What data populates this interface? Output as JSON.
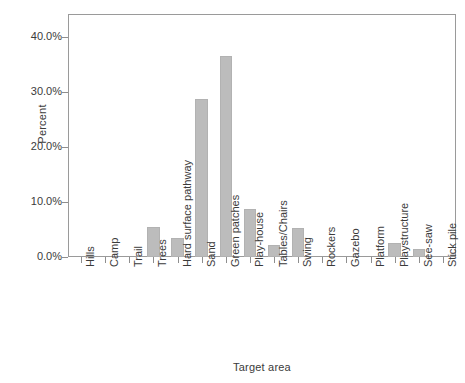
{
  "chart_data": {
    "type": "bar",
    "title": "",
    "xlabel": "Target area",
    "ylabel": "Percent",
    "ylim": [
      0,
      44
    ],
    "ytick_values": [
      0,
      10,
      20,
      30,
      40
    ],
    "ytick_labels": [
      "0.0%",
      "10.0%",
      "20.0%",
      "30.0%",
      "40.0%"
    ],
    "grid": false,
    "legend": false,
    "bar_color": "#bcbcbc",
    "categories": [
      "Hills",
      "Camp",
      "Trail",
      "Trees",
      "Hard surface pathway",
      "Sand",
      "Green patches",
      "Play-house",
      "Tables/Chairs",
      "Swing",
      "Rockers",
      "Gazebo",
      "Platform",
      "Playstructure",
      "See-saw",
      "Stick pile"
    ],
    "values": [
      0,
      0,
      0,
      5.4,
      3.4,
      28.8,
      36.6,
      8.7,
      2.2,
      5.2,
      0,
      0,
      0,
      2.6,
      1.5,
      0
    ]
  }
}
